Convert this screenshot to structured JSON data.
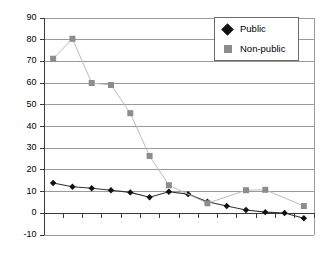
{
  "chart_data": {
    "type": "line",
    "title": "",
    "subtitle": "",
    "xlabel": "",
    "ylabel": "",
    "ylim": [
      -10,
      90
    ],
    "yticks": [
      90,
      80,
      70,
      60,
      50,
      40,
      30,
      20,
      10,
      0,
      -10
    ],
    "ytick_labels": [
      "90",
      "80",
      "70",
      "60",
      "50",
      "40",
      "30",
      "20",
      "10",
      "0",
      "-10"
    ],
    "grid": true,
    "xticks_count": 14,
    "xtick_labels": [],
    "legend_position": "top-right",
    "categories": [
      1,
      2,
      3,
      4,
      5,
      6,
      7,
      8,
      9,
      10,
      11,
      12,
      13,
      14
    ],
    "series": [
      {
        "name": "Public",
        "marker": "diamond",
        "color": "#111111",
        "line_color": "#333333",
        "x": [
          1,
          2,
          3,
          4,
          5,
          6,
          7,
          8,
          9,
          10,
          11,
          12,
          13,
          14
        ],
        "values": [
          13.7,
          12.0,
          11.3,
          10.4,
          9.4,
          7.2,
          9.7,
          8.6,
          5.1,
          3.1,
          1.3,
          0.3,
          -0.1,
          -2.5
        ]
      },
      {
        "name": "Non-public",
        "marker": "square",
        "color": "#8c8c8c",
        "line_color": "#bcbcbc",
        "x": [
          1,
          2,
          3,
          4,
          5,
          6,
          7,
          9,
          11,
          12,
          14
        ],
        "values": [
          71.0,
          80.2,
          59.8,
          58.9,
          45.9,
          26.2,
          12.7,
          4.4,
          10.4,
          10.6,
          3.1
        ]
      }
    ]
  },
  "legend": {
    "entries": [
      {
        "label": "Public",
        "marker": "diamond-marker-icon"
      },
      {
        "label": "Non-public",
        "marker": "square-marker-icon"
      }
    ]
  },
  "colors": {
    "public": "#111111",
    "non_public": "#8c8c8c",
    "gridline": "#9a9a9a",
    "axis": "#3a3a3a",
    "background": "#ffffff"
  }
}
